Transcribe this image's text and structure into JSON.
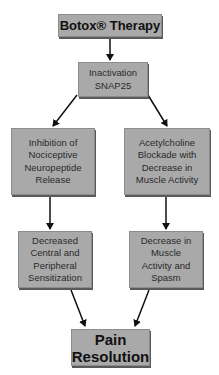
{
  "diagram": {
    "nodes": [
      {
        "id": "botox",
        "label": "Botox® Therapy"
      },
      {
        "id": "snap25",
        "lines": [
          "Inactivation",
          "SNAP25"
        ]
      },
      {
        "id": "inhibition",
        "lines": [
          "Inhibition of",
          "Nociceptive",
          "Neuropeptide",
          "Release"
        ]
      },
      {
        "id": "acetylcholine",
        "lines": [
          "Acetylcholine",
          "Blockade with",
          "Decrease in",
          "Muscle Activity"
        ]
      },
      {
        "id": "sensitization",
        "lines": [
          "Decreased",
          "Central and",
          "Peripheral",
          "Sensitization"
        ]
      },
      {
        "id": "spasm",
        "lines": [
          "Decrease in",
          "Muscle",
          "Activity and",
          "Spasm"
        ]
      },
      {
        "id": "pain",
        "lines": [
          "Pain",
          "Resolution"
        ]
      }
    ],
    "edges": [
      {
        "from": "botox",
        "to": "snap25"
      },
      {
        "from": "snap25",
        "to": "inhibition"
      },
      {
        "from": "snap25",
        "to": "acetylcholine"
      },
      {
        "from": "inhibition",
        "to": "sensitization"
      },
      {
        "from": "acetylcholine",
        "to": "spasm"
      },
      {
        "from": "sensitization",
        "to": "pain"
      },
      {
        "from": "spasm",
        "to": "pain"
      }
    ],
    "colors": {
      "box_fill": "#a9a9a9",
      "box_shadow": "#5a5a5a",
      "arrow": "#111111"
    }
  }
}
